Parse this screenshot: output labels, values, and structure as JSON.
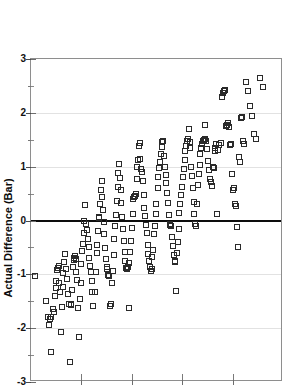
{
  "chart_data": {
    "type": "scatter",
    "title": "",
    "xlabel": "",
    "ylabel": "Actual Difference (Bar)",
    "ylim": [
      -3,
      3
    ],
    "yticks": [
      3,
      2,
      1,
      0,
      -1,
      -2,
      -3
    ],
    "ytick_labels": [
      "3",
      "2",
      "1",
      "0",
      "-1",
      "-2",
      "-3"
    ],
    "ytick_minor_step": 0.5,
    "xlim": [
      0,
      5
    ],
    "xticks": [
      0,
      1,
      2,
      3,
      4,
      5
    ],
    "xtick_labels": [
      "",
      "",
      "",
      "",
      "",
      ""
    ],
    "grid": "horizontal-major-faint",
    "zero_line": true,
    "zero_line_color": "#0d0d0d",
    "grid_color": "#e2e2e2",
    "frame_color": "#8e8e8e",
    "marker": "open-square",
    "marker_color": "#2a2a2a",
    "marker_size_px": 5,
    "n_points": 232,
    "points": [
      [
        0.07,
        -1.03
      ],
      [
        0.3,
        -1.49
      ],
      [
        0.33,
        -1.79
      ],
      [
        0.35,
        -1.95
      ],
      [
        0.37,
        -1.83
      ],
      [
        0.39,
        -1.8
      ],
      [
        0.4,
        -2.45
      ],
      [
        0.44,
        -1.64
      ],
      [
        0.45,
        -1.7
      ],
      [
        0.47,
        -1.4
      ],
      [
        0.49,
        -1.25
      ],
      [
        0.5,
        -1.12
      ],
      [
        0.52,
        -0.92
      ],
      [
        0.53,
        -0.88
      ],
      [
        0.55,
        -0.84
      ],
      [
        0.56,
        -1.17
      ],
      [
        0.58,
        -1.32
      ],
      [
        0.6,
        -2.08
      ],
      [
        0.62,
        -1.61
      ],
      [
        0.63,
        -1.23
      ],
      [
        0.64,
        -0.97
      ],
      [
        0.66,
        -0.78
      ],
      [
        0.68,
        -0.62
      ],
      [
        0.69,
        -0.9
      ],
      [
        0.71,
        -1.08
      ],
      [
        0.73,
        -1.36
      ],
      [
        0.75,
        -1.55
      ],
      [
        0.77,
        -2.62
      ],
      [
        0.79,
        -1.57
      ],
      [
        0.8,
        -1.56
      ],
      [
        0.82,
        -1.29
      ],
      [
        0.83,
        -0.86
      ],
      [
        0.85,
        -0.74
      ],
      [
        0.86,
        -0.7
      ],
      [
        0.87,
        -0.66
      ],
      [
        0.89,
        -0.71
      ],
      [
        0.9,
        -0.95
      ],
      [
        0.92,
        -1.1
      ],
      [
        0.94,
        -1.63
      ],
      [
        0.95,
        -2.17
      ],
      [
        0.97,
        -1.45
      ],
      [
        0.99,
        -1.16
      ],
      [
        1.0,
        -0.8
      ],
      [
        1.02,
        -0.56
      ],
      [
        1.03,
        -0.43
      ],
      [
        1.05,
        -0.24
      ],
      [
        1.06,
        0.0
      ],
      [
        1.08,
        0.28
      ],
      [
        1.1,
        -0.06
      ],
      [
        1.12,
        -0.18
      ],
      [
        1.13,
        -0.34
      ],
      [
        1.15,
        -0.49
      ],
      [
        1.16,
        -0.69
      ],
      [
        1.18,
        -0.84
      ],
      [
        1.19,
        -0.95
      ],
      [
        1.21,
        -1.12
      ],
      [
        1.22,
        -1.33
      ],
      [
        1.24,
        -1.58
      ],
      [
        1.26,
        -1.33
      ],
      [
        1.28,
        -0.96
      ],
      [
        1.3,
        -0.61
      ],
      [
        1.31,
        -0.46
      ],
      [
        1.33,
        -0.19
      ],
      [
        1.34,
        0.05
      ],
      [
        1.35,
        0.07
      ],
      [
        1.37,
        0.31
      ],
      [
        1.38,
        0.57
      ],
      [
        1.4,
        0.73
      ],
      [
        1.41,
        0.43
      ],
      [
        1.43,
        0.19
      ],
      [
        1.44,
        -0.02
      ],
      [
        1.45,
        -0.26
      ],
      [
        1.47,
        -0.52
      ],
      [
        1.48,
        -0.72
      ],
      [
        1.5,
        -0.86
      ],
      [
        1.51,
        -0.91
      ],
      [
        1.53,
        -1.01
      ],
      [
        1.55,
        -1.04
      ],
      [
        1.57,
        -1.58
      ],
      [
        1.58,
        -1.55
      ],
      [
        1.6,
        -1.17
      ],
      [
        1.62,
        -0.93
      ],
      [
        1.64,
        -0.64
      ],
      [
        1.65,
        -0.35
      ],
      [
        1.67,
        -0.11
      ],
      [
        1.68,
        0.1
      ],
      [
        1.7,
        0.36
      ],
      [
        1.72,
        0.63
      ],
      [
        1.73,
        0.88
      ],
      [
        1.75,
        1.05
      ],
      [
        1.76,
        0.79
      ],
      [
        1.78,
        0.57
      ],
      [
        1.79,
        0.33
      ],
      [
        1.81,
        0.06
      ],
      [
        1.83,
        -0.16
      ],
      [
        1.84,
        -0.39
      ],
      [
        1.86,
        -0.59
      ],
      [
        1.87,
        -0.76
      ],
      [
        1.89,
        -0.88
      ],
      [
        1.9,
        -0.91
      ],
      [
        1.92,
        -0.86
      ],
      [
        1.94,
        -1.63
      ],
      [
        1.95,
        -0.79
      ],
      [
        1.97,
        -0.58
      ],
      [
        1.99,
        -0.38
      ],
      [
        2.0,
        -0.14
      ],
      [
        2.02,
        0.12
      ],
      [
        2.03,
        0.4
      ],
      [
        2.05,
        0.43
      ],
      [
        2.06,
        0.46
      ],
      [
        2.08,
        0.5
      ],
      [
        2.1,
        0.77
      ],
      [
        2.11,
        1.0
      ],
      [
        2.13,
        1.13
      ],
      [
        2.14,
        1.39
      ],
      [
        2.16,
        1.44
      ],
      [
        2.17,
        1.15
      ],
      [
        2.19,
        0.95
      ],
      [
        2.21,
        0.9
      ],
      [
        2.22,
        0.73
      ],
      [
        2.24,
        0.48
      ],
      [
        2.25,
        0.24
      ],
      [
        2.27,
        0.08
      ],
      [
        2.28,
        -0.08
      ],
      [
        2.3,
        -0.24
      ],
      [
        2.32,
        -0.46
      ],
      [
        2.33,
        -0.62
      ],
      [
        2.35,
        -0.76
      ],
      [
        2.37,
        -0.86
      ],
      [
        2.38,
        -0.93
      ],
      [
        2.4,
        -0.91
      ],
      [
        2.41,
        -0.68
      ],
      [
        2.43,
        -0.54
      ],
      [
        2.44,
        -0.26
      ],
      [
        2.46,
        -0.11
      ],
      [
        2.48,
        0.13
      ],
      [
        2.49,
        0.31
      ],
      [
        2.51,
        0.6
      ],
      [
        2.52,
        0.8
      ],
      [
        2.54,
        0.97
      ],
      [
        2.56,
        1.09
      ],
      [
        2.57,
        1.23
      ],
      [
        2.59,
        1.36
      ],
      [
        2.6,
        1.45
      ],
      [
        2.62,
        1.47
      ],
      [
        2.64,
        1.2
      ],
      [
        2.65,
        1.0
      ],
      [
        2.67,
        0.85
      ],
      [
        2.68,
        0.69
      ],
      [
        2.7,
        0.52
      ],
      [
        2.72,
        0.33
      ],
      [
        2.73,
        0.1
      ],
      [
        2.75,
        -0.07
      ],
      [
        2.76,
        -0.09
      ],
      [
        2.78,
        -0.1
      ],
      [
        2.8,
        -0.31
      ],
      [
        2.81,
        -0.48
      ],
      [
        2.83,
        -0.64
      ],
      [
        2.85,
        -0.78
      ],
      [
        2.86,
        -0.76
      ],
      [
        2.88,
        -1.31
      ],
      [
        2.9,
        -0.6
      ],
      [
        2.91,
        -0.4
      ],
      [
        2.93,
        -0.15
      ],
      [
        2.94,
        0.14
      ],
      [
        2.96,
        0.3
      ],
      [
        2.98,
        0.47
      ],
      [
        2.99,
        0.62
      ],
      [
        3.01,
        0.8
      ],
      [
        3.03,
        0.95
      ],
      [
        3.05,
        1.12
      ],
      [
        3.06,
        1.29
      ],
      [
        3.08,
        1.38
      ],
      [
        3.09,
        1.48
      ],
      [
        3.11,
        1.51
      ],
      [
        3.13,
        1.7
      ],
      [
        3.15,
        1.45
      ],
      [
        3.16,
        1.35
      ],
      [
        3.18,
        1.0
      ],
      [
        3.19,
        0.82
      ],
      [
        3.21,
        0.6
      ],
      [
        3.23,
        0.35
      ],
      [
        3.24,
        0.12
      ],
      [
        3.26,
        -0.07
      ],
      [
        3.28,
        -0.1
      ],
      [
        3.3,
        0.3
      ],
      [
        3.31,
        0.66
      ],
      [
        3.33,
        0.87
      ],
      [
        3.35,
        1.04
      ],
      [
        3.36,
        1.23
      ],
      [
        3.38,
        1.34
      ],
      [
        3.4,
        1.42
      ],
      [
        3.41,
        1.48
      ],
      [
        3.43,
        1.49
      ],
      [
        3.45,
        1.52
      ],
      [
        3.46,
        1.77
      ],
      [
        3.48,
        1.47
      ],
      [
        3.5,
        1.33
      ],
      [
        3.52,
        1.1
      ],
      [
        3.54,
        0.93
      ],
      [
        3.55,
        0.78
      ],
      [
        3.57,
        0.72
      ],
      [
        3.59,
        0.64
      ],
      [
        3.61,
        1.0
      ],
      [
        3.63,
        0.98
      ],
      [
        3.65,
        1.29
      ],
      [
        3.66,
        1.35
      ],
      [
        3.68,
        1.42
      ],
      [
        3.7,
        0.12
      ],
      [
        3.72,
        1.31
      ],
      [
        3.74,
        1.4
      ],
      [
        3.76,
        1.44
      ],
      [
        3.78,
        2.3
      ],
      [
        3.8,
        2.36
      ],
      [
        3.82,
        2.4
      ],
      [
        3.84,
        2.42
      ],
      [
        3.86,
        1.75
      ],
      [
        3.88,
        1.78
      ],
      [
        3.9,
        1.82
      ],
      [
        3.92,
        1.73
      ],
      [
        3.94,
        1.4
      ],
      [
        3.96,
        1.42
      ],
      [
        3.98,
        0.86
      ],
      [
        4.0,
        0.57
      ],
      [
        4.02,
        0.6
      ],
      [
        4.04,
        0.3
      ],
      [
        4.06,
        0.27
      ],
      [
        4.08,
        -0.13
      ],
      [
        4.1,
        -0.49
      ],
      [
        4.12,
        1.18
      ],
      [
        4.14,
        1.08
      ],
      [
        4.16,
        1.9
      ],
      [
        4.18,
        1.93
      ],
      [
        4.2,
        1.47
      ],
      [
        4.22,
        1.43
      ],
      [
        4.26,
        2.57
      ],
      [
        4.3,
        2.4
      ],
      [
        4.34,
        2.12
      ],
      [
        4.38,
        1.94
      ],
      [
        4.42,
        1.6
      ],
      [
        4.46,
        1.51
      ],
      [
        4.54,
        2.64
      ],
      [
        4.6,
        2.48
      ]
    ]
  }
}
